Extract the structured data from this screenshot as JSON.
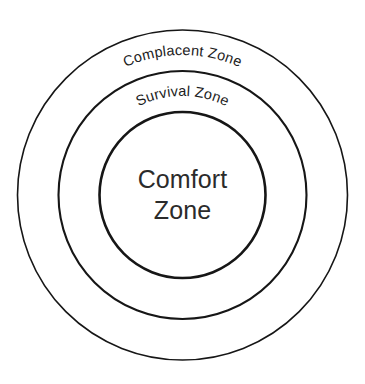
{
  "diagram": {
    "type": "concentric-circles",
    "background_color": "#ffffff",
    "stroke_color": "#161616",
    "text_color": "#2b2b2b",
    "center": {
      "x": 182.5,
      "y": 195
    },
    "zones": [
      {
        "id": "complacent",
        "label": "Complacent Zone",
        "radius": 165,
        "stroke_width": 1.6,
        "label_style": "curved-arc",
        "label_arc_radius": 140,
        "label_font_size": 14.5
      },
      {
        "id": "survival",
        "label": "Survival Zone",
        "radius": 124,
        "stroke_width": 2.1,
        "label_style": "curved-arc",
        "label_arc_radius": 99,
        "label_font_size": 14.5
      },
      {
        "id": "comfort",
        "label": "Comfort Zone",
        "label_line_1": "Comfort",
        "label_line_2": "Zone",
        "radius": 83,
        "stroke_width": 2.6,
        "label_style": "horizontal-two-line",
        "label_font_size": 25
      }
    ]
  }
}
